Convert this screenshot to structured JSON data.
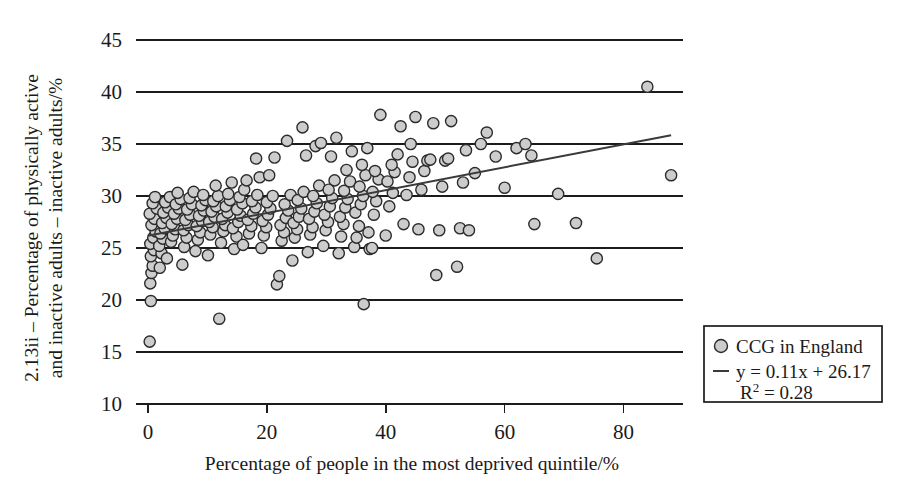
{
  "chart_data": {
    "type": "scatter",
    "title": "",
    "xlabel": "Percentage of people in the most deprived quintile/%",
    "ylabel_line1": "2.13ii – Percentage of physically active",
    "ylabel_line2": "and inactive adults – inactive adults/%",
    "xlim": [
      -2,
      90
    ],
    "ylim": [
      10,
      45
    ],
    "xticks": [
      0,
      20,
      40,
      60,
      80
    ],
    "yticks": [
      10,
      15,
      20,
      25,
      30,
      35,
      40,
      45
    ],
    "grid": "horizontal",
    "legend_position": "right-outside",
    "series": [
      {
        "name": "CCG in England",
        "marker": "circle",
        "marker_fill": "#cccccc",
        "marker_stroke": "#2b2b2b",
        "points": [
          [
            0.3,
            16.0
          ],
          [
            0.5,
            19.9
          ],
          [
            0.4,
            21.6
          ],
          [
            0.6,
            22.6
          ],
          [
            0.8,
            23.3
          ],
          [
            0.5,
            24.2
          ],
          [
            1.0,
            24.8
          ],
          [
            0.4,
            25.4
          ],
          [
            0.9,
            26.0
          ],
          [
            1.3,
            26.6
          ],
          [
            0.6,
            27.2
          ],
          [
            1.1,
            27.8
          ],
          [
            0.3,
            28.3
          ],
          [
            1.5,
            28.8
          ],
          [
            0.8,
            29.3
          ],
          [
            1.2,
            29.9
          ],
          [
            2.0,
            23.1
          ],
          [
            2.3,
            24.5
          ],
          [
            1.9,
            25.2
          ],
          [
            2.5,
            25.9
          ],
          [
            2.1,
            26.4
          ],
          [
            2.8,
            26.9
          ],
          [
            2.4,
            27.4
          ],
          [
            3.1,
            27.9
          ],
          [
            2.6,
            28.4
          ],
          [
            3.4,
            28.9
          ],
          [
            2.9,
            29.4
          ],
          [
            3.7,
            29.9
          ],
          [
            3.2,
            24.0
          ],
          [
            3.9,
            25.6
          ],
          [
            4.2,
            26.2
          ],
          [
            4.6,
            26.8
          ],
          [
            4.0,
            27.3
          ],
          [
            4.9,
            27.8
          ],
          [
            4.4,
            28.3
          ],
          [
            5.2,
            28.8
          ],
          [
            4.7,
            29.2
          ],
          [
            5.5,
            29.7
          ],
          [
            5.0,
            30.3
          ],
          [
            5.8,
            23.4
          ],
          [
            6.1,
            25.1
          ],
          [
            6.5,
            26.0
          ],
          [
            6.0,
            26.7
          ],
          [
            6.8,
            27.2
          ],
          [
            6.3,
            27.7
          ],
          [
            7.1,
            28.2
          ],
          [
            6.6,
            28.7
          ],
          [
            7.4,
            29.2
          ],
          [
            7.0,
            29.8
          ],
          [
            7.7,
            30.4
          ],
          [
            8.0,
            24.7
          ],
          [
            8.4,
            25.8
          ],
          [
            8.8,
            26.5
          ],
          [
            8.2,
            27.1
          ],
          [
            9.1,
            27.6
          ],
          [
            8.6,
            28.1
          ],
          [
            9.4,
            28.6
          ],
          [
            9.0,
            29.1
          ],
          [
            9.7,
            29.6
          ],
          [
            9.3,
            30.1
          ],
          [
            10.1,
            24.3
          ],
          [
            10.5,
            26.3
          ],
          [
            10.9,
            27.0
          ],
          [
            10.3,
            27.5
          ],
          [
            11.2,
            28.0
          ],
          [
            10.7,
            28.5
          ],
          [
            11.5,
            29.0
          ],
          [
            11.0,
            29.5
          ],
          [
            11.8,
            30.0
          ],
          [
            11.4,
            31.0
          ],
          [
            12.0,
            18.2
          ],
          [
            12.3,
            25.5
          ],
          [
            12.7,
            26.6
          ],
          [
            13.0,
            27.2
          ],
          [
            12.5,
            27.8
          ],
          [
            13.4,
            28.4
          ],
          [
            13.1,
            29.0
          ],
          [
            13.8,
            29.6
          ],
          [
            13.5,
            30.2
          ],
          [
            14.1,
            31.3
          ],
          [
            14.5,
            24.9
          ],
          [
            14.9,
            26.1
          ],
          [
            14.3,
            26.9
          ],
          [
            15.2,
            27.5
          ],
          [
            15.6,
            28.1
          ],
          [
            15.0,
            28.7
          ],
          [
            15.9,
            29.3
          ],
          [
            15.4,
            29.9
          ],
          [
            16.2,
            30.6
          ],
          [
            16.6,
            31.5
          ],
          [
            16.0,
            25.3
          ],
          [
            17.0,
            26.4
          ],
          [
            17.4,
            27.1
          ],
          [
            16.8,
            27.7
          ],
          [
            17.7,
            28.3
          ],
          [
            18.1,
            28.9
          ],
          [
            17.5,
            29.5
          ],
          [
            18.4,
            30.1
          ],
          [
            18.8,
            31.8
          ],
          [
            18.2,
            33.6
          ],
          [
            19.1,
            25.0
          ],
          [
            19.5,
            26.2
          ],
          [
            19.9,
            27.0
          ],
          [
            19.3,
            27.6
          ],
          [
            20.2,
            28.2
          ],
          [
            20.6,
            28.8
          ],
          [
            20.0,
            29.4
          ],
          [
            21.0,
            30.0
          ],
          [
            20.4,
            32.0
          ],
          [
            21.3,
            33.7
          ],
          [
            21.7,
            21.5
          ],
          [
            22.1,
            22.3
          ],
          [
            22.5,
            25.7
          ],
          [
            22.9,
            26.5
          ],
          [
            22.3,
            27.2
          ],
          [
            23.2,
            27.9
          ],
          [
            23.6,
            28.6
          ],
          [
            23.0,
            29.2
          ],
          [
            24.0,
            30.1
          ],
          [
            23.4,
            35.3
          ],
          [
            24.3,
            23.8
          ],
          [
            24.7,
            26.0
          ],
          [
            25.1,
            26.8
          ],
          [
            24.5,
            27.4
          ],
          [
            25.4,
            28.0
          ],
          [
            25.8,
            28.8
          ],
          [
            25.2,
            29.6
          ],
          [
            26.2,
            30.4
          ],
          [
            26.6,
            33.9
          ],
          [
            26.0,
            36.6
          ],
          [
            26.9,
            24.6
          ],
          [
            27.3,
            26.3
          ],
          [
            27.7,
            27.0
          ],
          [
            27.1,
            27.8
          ],
          [
            28.0,
            28.5
          ],
          [
            28.4,
            29.3
          ],
          [
            27.8,
            30.0
          ],
          [
            28.8,
            31.0
          ],
          [
            28.2,
            34.8
          ],
          [
            29.1,
            35.1
          ],
          [
            29.5,
            25.2
          ],
          [
            29.9,
            26.7
          ],
          [
            30.3,
            27.5
          ],
          [
            29.7,
            28.2
          ],
          [
            30.6,
            29.0
          ],
          [
            31.0,
            29.8
          ],
          [
            30.4,
            30.6
          ],
          [
            31.4,
            31.5
          ],
          [
            30.8,
            33.8
          ],
          [
            31.7,
            35.6
          ],
          [
            32.1,
            24.5
          ],
          [
            32.5,
            26.1
          ],
          [
            32.9,
            27.3
          ],
          [
            32.3,
            28.0
          ],
          [
            33.2,
            28.9
          ],
          [
            33.6,
            29.7
          ],
          [
            33.0,
            30.5
          ],
          [
            34.0,
            31.4
          ],
          [
            33.4,
            32.5
          ],
          [
            34.3,
            34.3
          ],
          [
            34.7,
            25.1
          ],
          [
            35.1,
            26.0
          ],
          [
            35.5,
            27.1
          ],
          [
            34.9,
            28.4
          ],
          [
            35.8,
            29.2
          ],
          [
            36.2,
            30.0
          ],
          [
            35.6,
            30.9
          ],
          [
            36.6,
            32.0
          ],
          [
            36.0,
            33.0
          ],
          [
            36.9,
            34.6
          ],
          [
            36.3,
            19.6
          ],
          [
            37.3,
            24.9
          ],
          [
            37.7,
            25.0
          ],
          [
            37.1,
            26.5
          ],
          [
            38.0,
            28.2
          ],
          [
            38.4,
            29.5
          ],
          [
            37.8,
            30.4
          ],
          [
            38.8,
            31.6
          ],
          [
            38.2,
            32.4
          ],
          [
            39.1,
            37.8
          ],
          [
            40.0,
            26.2
          ],
          [
            40.6,
            29.0
          ],
          [
            41.2,
            30.3
          ],
          [
            40.3,
            31.4
          ],
          [
            41.5,
            32.3
          ],
          [
            41.0,
            33.0
          ],
          [
            42.0,
            34.0
          ],
          [
            42.5,
            36.7
          ],
          [
            43.0,
            27.3
          ],
          [
            43.5,
            30.1
          ],
          [
            44.0,
            31.8
          ],
          [
            44.5,
            33.3
          ],
          [
            44.2,
            35.0
          ],
          [
            45.0,
            37.6
          ],
          [
            45.5,
            26.8
          ],
          [
            46.0,
            30.6
          ],
          [
            46.5,
            32.4
          ],
          [
            47.0,
            33.4
          ],
          [
            47.5,
            33.5
          ],
          [
            48.0,
            37.0
          ],
          [
            48.5,
            22.4
          ],
          [
            49.0,
            26.7
          ],
          [
            49.5,
            30.9
          ],
          [
            50.0,
            33.4
          ],
          [
            50.5,
            33.6
          ],
          [
            51.0,
            37.2
          ],
          [
            52.0,
            23.2
          ],
          [
            52.5,
            26.9
          ],
          [
            53.0,
            31.3
          ],
          [
            53.5,
            34.4
          ],
          [
            54.0,
            26.7
          ],
          [
            55.0,
            32.2
          ],
          [
            56.0,
            35.0
          ],
          [
            57.0,
            36.1
          ],
          [
            58.5,
            33.8
          ],
          [
            60.0,
            30.8
          ],
          [
            62.0,
            34.6
          ],
          [
            63.5,
            35.0
          ],
          [
            64.5,
            33.9
          ],
          [
            65.0,
            27.3
          ],
          [
            69.0,
            30.2
          ],
          [
            72.0,
            27.4
          ],
          [
            75.5,
            24.0
          ],
          [
            84.0,
            40.5
          ],
          [
            88.0,
            32.0
          ]
        ]
      }
    ],
    "trendline": {
      "equation_label": "y = 0.11x + 26.17",
      "r2_label": "R² = 0.28",
      "r2_value": 0.28,
      "slope": 0.11,
      "intercept": 26.17,
      "x_start": 0,
      "x_end": 88
    }
  },
  "legend": {
    "series_label": "CCG in England",
    "equation": "y = 0.11x + 26.17",
    "r2_base": "R",
    "r2_exponent": "2",
    "r2_rest": " = 0.28"
  },
  "axes": {
    "x_title": "Percentage of people in the most deprived quintile/%",
    "y_title_line1": "2.13ii – Percentage of physically active",
    "y_title_line2": "and inactive adults – inactive adults/%",
    "x_tick_labels": [
      "0",
      "20",
      "40",
      "60",
      "80"
    ],
    "y_tick_labels": [
      "45",
      "40",
      "35",
      "30",
      "25",
      "20",
      "15",
      "10"
    ]
  },
  "colors": {
    "marker_fill": "#cccccc",
    "marker_stroke": "#2b2b2b",
    "line": "#3a3a3a",
    "grid": "#1c1c1c",
    "text": "#1a1a1a",
    "background": "#ffffff"
  }
}
